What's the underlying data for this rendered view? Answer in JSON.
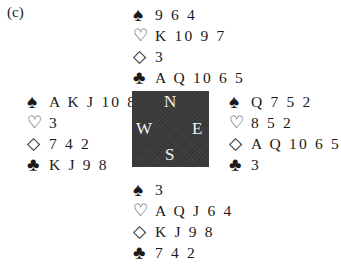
{
  "label": "(c)",
  "suits": {
    "spade": "♠",
    "heart": "♡",
    "diamond": "◇",
    "club": "♣"
  },
  "compass": {
    "n": "N",
    "s": "S",
    "w": "W",
    "e": "E"
  },
  "hands": {
    "north": {
      "spades": "9 6 4",
      "hearts": "K 10 9 7",
      "diamonds": "3",
      "clubs": "A Q 10 6 5"
    },
    "west": {
      "spades": "A K J 10 8",
      "hearts": "3",
      "diamonds": "7 4 2",
      "clubs": "K J 9 8"
    },
    "east": {
      "spades": "Q 7 5 2",
      "hearts": "8 5 2",
      "diamonds": "A Q 10 6 5",
      "clubs": "3"
    },
    "south": {
      "spades": "3",
      "hearts": "A Q J 6 4",
      "diamonds": "K J 9 8",
      "clubs": "7 4 2"
    }
  }
}
